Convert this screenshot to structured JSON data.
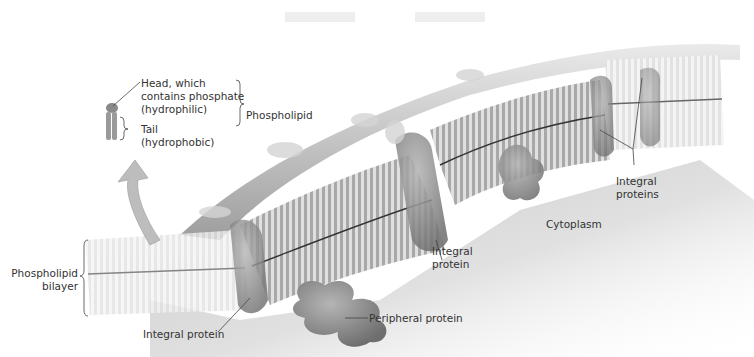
{
  "diagram": {
    "labels": {
      "head": "Head, which\ncontains phosphate\n(hydrophilic)",
      "tail": "Tail\n(hydrophobic)",
      "phospholipid": "Phospholipid",
      "bilayer": "Phospholipid\nbilayer",
      "integral_protein_bottom": "Integral protein",
      "integral_protein_middle": "Integral\nprotein",
      "integral_proteins_right": "Integral\nproteins",
      "cytoplasm": "Cytoplasm",
      "peripheral_protein": "Peripheral protein"
    },
    "colors": {
      "membrane_dark": "#5a5a5a",
      "membrane_light": "#d8d8d8",
      "protein": "#8a8a8a",
      "cytoplasm_shade": "#b8b8b8",
      "arrow": "#bdbdbd",
      "text": "#333333"
    }
  }
}
